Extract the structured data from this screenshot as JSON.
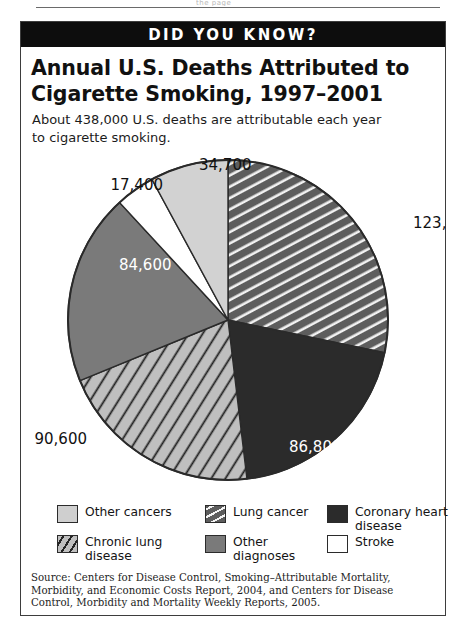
{
  "page": {
    "top_rule_ghost_text": "the page"
  },
  "banner": {
    "label": "DID YOU KNOW?"
  },
  "headline": "Annual U.S. Deaths Attributed to Cigarette Smoking, 1997–2001",
  "subhead": "About 438,000 U.S. deaths are attributable each year to cigarette smoking.",
  "source_note": "Source: Centers for Disease  Control, Smoking–Attributable Mortality, Morbidity, and Economic Costs Report, 2004, and Centers for Disease Control, Morbidity and Mortality Weekly Reports, 2005.",
  "legend": {
    "items": [
      {
        "label": "Other cancers",
        "swatch": "light-gray-solid",
        "color": "#cfcfcf"
      },
      {
        "label": "Lung cancer",
        "swatch": "dark-gray-white-stripes",
        "color": "#5d5d5d"
      },
      {
        "label": "Coronary heart disease",
        "swatch": "near-black-solid",
        "color": "#2b2b2b"
      },
      {
        "label": "Chronic lung disease",
        "swatch": "light-gray-black-stripes",
        "color": "#bfbfbf"
      },
      {
        "label": "Other diagnoses",
        "swatch": "medium-gray-solid",
        "color": "#7a7a7a"
      },
      {
        "label": "Stroke",
        "swatch": "white-solid",
        "color": "#ffffff"
      }
    ]
  },
  "chart_data": {
    "type": "pie",
    "title": "Annual U.S. Deaths Attributed to Cigarette Smoking, 1997–2001",
    "subtitle": "About 438,000 U.S. deaths are attributable each year to cigarette smoking.",
    "unit": "deaths per year",
    "total": 437900,
    "total_label": "438,000",
    "legend_position": "bottom",
    "grid": false,
    "start_angle_deg": 0,
    "direction": "clockwise",
    "categories": [
      "Lung cancer",
      "Coronary heart disease",
      "Chronic lung disease",
      "Other diagnoses",
      "Stroke",
      "Other cancers"
    ],
    "values": [
      123800,
      86800,
      90600,
      84600,
      17400,
      34700
    ],
    "labels": [
      "123,800",
      "86,800",
      "90,600",
      "84,600",
      "17,400",
      "34,700"
    ],
    "slices": [
      {
        "name": "Lung cancer",
        "value": 123800,
        "label": "123,800",
        "percent": 28.3,
        "start_deg": 0.0,
        "end_deg": 101.8,
        "fill": "#5d5d5d",
        "pattern": "white-diagonal-stripes",
        "label_placement": "outside-right",
        "label_color": "#111111"
      },
      {
        "name": "Coronary heart disease",
        "value": 86800,
        "label": "86,800",
        "percent": 19.8,
        "start_deg": 101.8,
        "end_deg": 173.2,
        "fill": "#2b2b2b",
        "pattern": "solid",
        "label_placement": "inside",
        "label_color": "#ffffff"
      },
      {
        "name": "Chronic lung disease",
        "value": 90600,
        "label": "90,600",
        "percent": 20.7,
        "start_deg": 173.2,
        "end_deg": 247.7,
        "fill": "#bfbfbf",
        "pattern": "black-diagonal-stripes",
        "label_placement": "outside-left",
        "label_color": "#111111"
      },
      {
        "name": "Other diagnoses",
        "value": 84600,
        "label": "84,600",
        "percent": 19.3,
        "start_deg": 247.7,
        "end_deg": 317.3,
        "fill": "#7a7a7a",
        "pattern": "solid",
        "label_placement": "inside",
        "label_color": "#ffffff"
      },
      {
        "name": "Stroke",
        "value": 17400,
        "label": "17,400",
        "percent": 4.0,
        "start_deg": 317.3,
        "end_deg": 331.6,
        "fill": "#ffffff",
        "pattern": "solid",
        "label_placement": "outside-upper-left",
        "label_color": "#111111"
      },
      {
        "name": "Other cancers",
        "value": 34700,
        "label": "34,700",
        "percent": 7.9,
        "start_deg": 331.6,
        "end_deg": 360.0,
        "fill": "#d2d2d2",
        "pattern": "solid",
        "label_placement": "outside-top",
        "label_color": "#111111"
      }
    ]
  }
}
